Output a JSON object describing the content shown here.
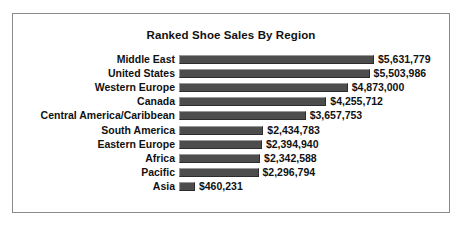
{
  "chart_data": {
    "type": "bar",
    "orientation": "horizontal",
    "title": "Ranked Shoe Sales By Region",
    "xlabel": "",
    "ylabel": "",
    "grid": false,
    "legend": null,
    "axis_ticks": [],
    "xlim": [
      0,
      5631779
    ],
    "categories": [
      "Middle East",
      "United States",
      "Western Europe",
      "Canada",
      "Central America/Caribbean",
      "South America",
      "Eastern Europe",
      "Africa",
      "Pacific",
      "Asia"
    ],
    "values": [
      5631779,
      5503986,
      4873000,
      4255712,
      3657753,
      2434783,
      2394940,
      2342588,
      2296794,
      460231
    ],
    "data_labels": [
      "$5,631,779",
      "$5,503,986",
      "$4,873,000",
      "$4,255,712",
      "$3,657,753",
      "$2,434,783",
      "$2,394,940",
      "$2,342,588",
      "$2,296,794",
      "$460,231"
    ],
    "bar_color": "#4d4d4d",
    "text_color": "#111111",
    "frame_color": "#8a8a8a",
    "background_color": "#ffffff"
  },
  "rows": [
    {
      "label": "Middle East",
      "value": "$5,631,779",
      "amount": 5631779
    },
    {
      "label": "United States",
      "value": "$5,503,986",
      "amount": 5503986
    },
    {
      "label": "Western Europe",
      "value": "$4,873,000",
      "amount": 4873000
    },
    {
      "label": "Canada",
      "value": "$4,255,712",
      "amount": 4255712
    },
    {
      "label": "Central America/Caribbean",
      "value": "$3,657,753",
      "amount": 3657753
    },
    {
      "label": "South America",
      "value": "$2,434,783",
      "amount": 2434783
    },
    {
      "label": "Eastern Europe",
      "value": "$2,394,940",
      "amount": 2394940
    },
    {
      "label": "Africa",
      "value": "$2,342,588",
      "amount": 2342588
    },
    {
      "label": "Pacific",
      "value": "$2,296,794",
      "amount": 2296794
    },
    {
      "label": "Asia",
      "value": "$460,231",
      "amount": 460231
    }
  ]
}
